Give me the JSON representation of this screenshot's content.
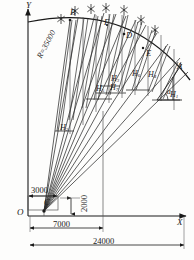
{
  "diagram": {
    "axes": {
      "x_label": "X",
      "y_label": "Y",
      "origin_label": "O"
    },
    "points": {
      "a": "A",
      "b": "B",
      "c": "C",
      "d": "D",
      "e": "E",
      "f": "F"
    },
    "angle_label": "a",
    "arc_label": "R=35000",
    "heights": [
      {
        "name": "h1",
        "base": "H",
        "sub": "1"
      },
      {
        "name": "h4",
        "base": "H",
        "sub": "4"
      },
      {
        "name": "h5",
        "base": "H",
        "sub": "5"
      },
      {
        "name": "h6",
        "base": "H",
        "sub": "6"
      },
      {
        "name": "h7",
        "base": "H",
        "sub": "7"
      },
      {
        "name": "h3",
        "base": "H",
        "sub": "3"
      },
      {
        "name": "h2",
        "base": "H",
        "sub": "2"
      }
    ],
    "dimensions": [
      {
        "name": "dim-3000",
        "value": "3000"
      },
      {
        "name": "dim-2000",
        "value": "2000"
      },
      {
        "name": "dim-7000",
        "value": "7000"
      },
      {
        "name": "dim-24000",
        "value": "24000"
      }
    ],
    "colors": {
      "ink": "#1a1a1a",
      "line": "#2b2b2b",
      "thin": "#555555",
      "paper": "#fdfdfc"
    }
  }
}
